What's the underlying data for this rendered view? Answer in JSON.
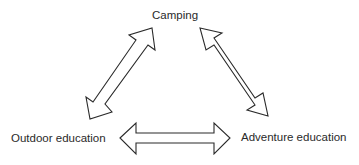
{
  "diagram": {
    "type": "triangle-cycle",
    "nodes": {
      "top": {
        "label": "Camping"
      },
      "left": {
        "label": "Outdoor education"
      },
      "right": {
        "label": "Adventure education"
      }
    },
    "edges": [
      {
        "from": "Camping",
        "to": "Outdoor education",
        "style": "double-headed hollow arrow"
      },
      {
        "from": "Camping",
        "to": "Adventure education",
        "style": "double-headed hollow arrow"
      },
      {
        "from": "Outdoor education",
        "to": "Adventure education",
        "style": "double-headed hollow arrow"
      }
    ],
    "colors": {
      "stroke": "#2a2a2a",
      "fill": "#ffffff",
      "text": "#2a2a2a",
      "background": "#ffffff"
    }
  }
}
